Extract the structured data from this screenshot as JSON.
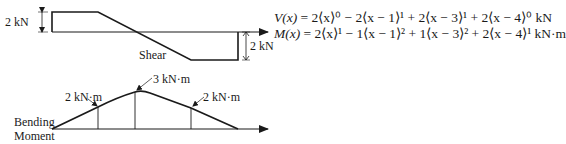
{
  "shear_diagram": {
    "title": "Shear",
    "left_dimension": "2 kN",
    "right_dimension": "2 kN"
  },
  "moment_diagram": {
    "title_line1": "Bending",
    "title_line2": "Moment",
    "labels": [
      "2 kN·m",
      "3 kN·m",
      "2 kN·m"
    ]
  },
  "equations": {
    "shear_lhs": "V(x)",
    "shear_rhs": " = 2⟨x⟩⁰ − 2⟨x − 1⟩¹ + 2⟨x − 3⟩¹ + 2⟨x − 4⟩⁰ kN",
    "moment_lhs": "M(x)",
    "moment_rhs": " = 2⟨x⟩¹ − 1⟨x − 1⟩² + 1⟨x − 3⟩² + 2⟨x − 4⟩¹ kN·m"
  }
}
